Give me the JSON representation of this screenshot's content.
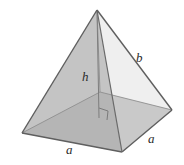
{
  "figure": {
    "name": "square-pyramid",
    "background_color": "#ffffff",
    "labels": {
      "height": "h",
      "slant_edge": "b",
      "base_edge_front": "a",
      "base_edge_right": "a"
    },
    "colors": {
      "outline": "#6e6e6e",
      "left_face": "#c9c9c9",
      "right_face": "#efefef",
      "base_left": "#ababab",
      "base_right": "#bdbdbd",
      "base_front_strip": "#b5b5b5",
      "height_line": "#8a8a8a",
      "label_text": "#2b2b2b"
    },
    "geometry": {
      "apex": [
        97,
        10
      ],
      "left_corner": [
        22,
        133
      ],
      "front_corner": [
        122,
        152
      ],
      "right_corner": [
        172,
        110
      ],
      "back_corner": [
        100,
        92
      ],
      "base_center": [
        99,
        120
      ]
    },
    "annotations": {
      "right_angle_marker": "right-angle at base of altitude"
    }
  }
}
